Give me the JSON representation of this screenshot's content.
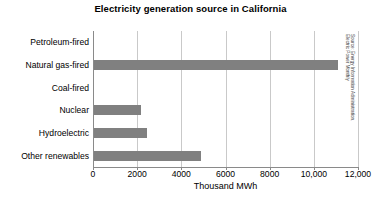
{
  "chart_data": {
    "type": "bar",
    "orientation": "horizontal",
    "title": "Electricity generation source in California",
    "xlabel": "Thousand MWh",
    "ylabel": "",
    "categories": [
      "Petroleum-fired",
      "Natural gas-fired",
      "Coal-fired",
      "Nuclear",
      "Hydroelectric",
      "Other renewables"
    ],
    "values": [
      0,
      11050,
      0,
      2150,
      2400,
      4850
    ],
    "xlim": [
      0,
      12000
    ],
    "xticks": [
      0,
      2000,
      4000,
      6000,
      8000,
      10000,
      12000
    ],
    "xtick_labels": [
      "0",
      "2000",
      "4000",
      "6000",
      "8000",
      "10,000",
      "12,000"
    ],
    "grid": "vertical",
    "legend": null,
    "bar_color": "#808080",
    "grid_color": "#c9c9c9",
    "axis_color": "#8a8a8a",
    "background_color": "#ffffff"
  },
  "annotations": {
    "source_line_1": "Source: Energy Information Administration,",
    "source_line_2": "Electric Power Monthly"
  }
}
